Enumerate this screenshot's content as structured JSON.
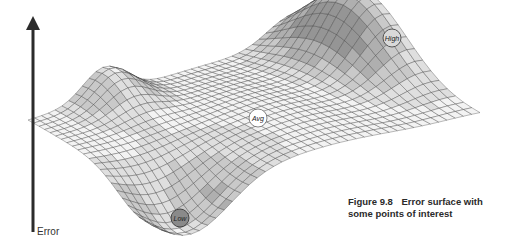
{
  "figure": {
    "number": "Figure 9.8",
    "caption": "Error surface with some points of interest",
    "caption_line1": "Error surface with",
    "caption_line2": "some points of interest"
  },
  "axis": {
    "label": "Error",
    "color": "#2b2b2b",
    "x": 33,
    "y_top": 18,
    "y_bottom": 232
  },
  "points": [
    {
      "id": "high",
      "label": "High",
      "x": 392,
      "y": 38,
      "r": 9,
      "fill": "#d9d9d9"
    },
    {
      "id": "avg",
      "label": "Avg",
      "x": 258,
      "y": 118,
      "r": 9,
      "fill": "#ffffff"
    },
    {
      "id": "low",
      "label": "Low",
      "x": 180,
      "y": 218,
      "r": 9,
      "fill": "#8a8a8a"
    }
  ],
  "surface": {
    "rows": 22,
    "cols": 40,
    "grid_color": "#3a3a3a",
    "corners": {
      "back_left": [
        28,
        120
      ],
      "back_right": [
        300,
        40
      ],
      "front_left": [
        150,
        190
      ],
      "front_right": [
        480,
        115
      ]
    },
    "shades": [
      "#f2f2f2",
      "#dcdcdc",
      "#c4c4c4",
      "#a8a8a8",
      "#8c8c8c",
      "#707070",
      "#5a5a5a"
    ]
  },
  "chart_data": {
    "type": "surface",
    "title": "Figure 9.8 Error surface with some points of interest",
    "zlabel": "Error",
    "annotations": [
      "High",
      "Avg",
      "Low"
    ]
  }
}
